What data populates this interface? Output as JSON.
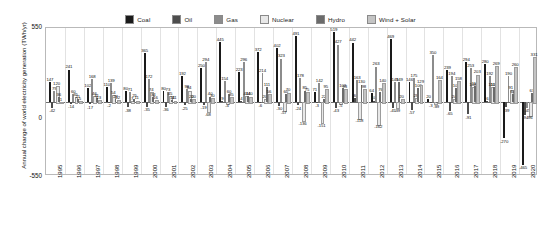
{
  "axis": {
    "y_title": "Annual change of world electricity generation (TWh/yr)",
    "y_top": "550",
    "y_mid": "0",
    "y_bottom": "-550"
  },
  "legend": [
    {
      "label": "Coal",
      "color": "#1a1a1a"
    },
    {
      "label": "Oil",
      "color": "#4d4d4d"
    },
    {
      "label": "Gas",
      "color": "#8c8c8c"
    },
    {
      "label": "Nuclear",
      "color": "#e8e8e8"
    },
    {
      "label": "Hydro",
      "color": "#6b6b6b"
    },
    {
      "label": "Wind + Solar",
      "color": "#c4c4c4"
    }
  ],
  "caption": "",
  "chart_data": {
    "type": "bar",
    "title": "",
    "xlabel": "",
    "ylabel": "Annual change of world electricity generation (TWh/yr)",
    "ylim": [
      -550,
      550
    ],
    "grid": true,
    "legend_position": "top",
    "categories": [
      "1995",
      "1996",
      "1997",
      "1998",
      "1999",
      "2000",
      "2001",
      "2002",
      "2003",
      "2004",
      "2005",
      "2006",
      "2007",
      "2008",
      "2009",
      "2010",
      "2011",
      "2012",
      "2013",
      "2014",
      "2015",
      "2016",
      "2017",
      "2018",
      "2019",
      "2020"
    ],
    "series": [
      {
        "name": "Coal",
        "values": [
          147,
          241,
          102,
          110,
          80,
          365,
          80,
          192,
          250,
          445,
          223,
          372,
          402,
          491,
          71,
          519,
          442,
          64,
          469,
          146,
          20,
          239,
          294,
          280,
          -270,
          -465
        ]
      },
      {
        "name": "Oil",
        "values": [
          -42,
          -14,
          -17,
          -2,
          -38,
          -35,
          -36,
          -25,
          -19,
          9,
          4,
          -6,
          -30,
          -24,
          -3,
          -43,
          30,
          10,
          -45,
          -57,
          -3,
          -65,
          -91,
          6,
          -39,
          -94
        ]
      },
      {
        "name": "Gas",
        "values": [
          79,
          60,
          168,
          139,
          71,
          172,
          73,
          98,
          294,
          154,
          296,
          214,
          323,
          178,
          142,
          427,
          163,
          263,
          149,
          175,
          350,
          194,
          253,
          192,
          190,
          -45
        ]
      },
      {
        "name": "Nuclear",
        "values": [
          120,
          35,
          46,
          54,
          7,
          74,
          45,
          84,
          -68,
          -4,
          41,
          20,
          -57,
          -136,
          -151,
          -5,
          -118,
          -162,
          -39,
          28,
          -9,
          24,
          108,
          110,
          91,
          -96
        ]
      },
      {
        "name": "Hydro",
        "values": [
          36,
          21,
          31,
          23,
          25,
          34,
          14,
          20,
          40,
          60,
          44,
          111,
          60,
          85,
          22,
          103,
          130,
          76,
          149,
          106,
          -9,
          103,
          116,
          111,
          60,
          67
        ]
      },
      {
        "name": "Wind + Solar",
        "values": [
          1,
          5,
          13,
          12,
          11,
          16,
          11,
          20,
          30,
          35,
          40,
          56,
          70,
          75,
          95,
          93,
          98,
          140,
          20,
          129,
          164,
          158,
          203,
          269,
          260,
          331
        ]
      }
    ],
    "value_labels_shown": true
  }
}
